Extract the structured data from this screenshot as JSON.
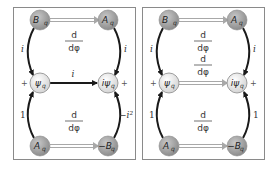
{
  "colors": {
    "frame": "#8a8a8a",
    "dark_node": "#9a9a9a",
    "light_node": "#e6e6e6",
    "arrow_dark": "#1a1a1a",
    "arrow_double": "#a8a8a8"
  },
  "panels": [
    {
      "name": "left",
      "nodes": {
        "top_left": {
          "main": "B",
          "sub": "q"
        },
        "top_right": {
          "main": "A",
          "sub": "q"
        },
        "mid_left": {
          "main": "ψ",
          "sub": "q"
        },
        "mid_right": {
          "main": "iψ",
          "sub": "q"
        },
        "bot_left": {
          "main": "A",
          "sub": "q"
        },
        "bot_right": {
          "main": "−B",
          "sub": "q"
        }
      },
      "edges": {
        "top_deriv_num": "d",
        "top_deriv_den": "dφ",
        "left_top": "i",
        "right_top": "i",
        "middle": "i",
        "bot_deriv_num": "d",
        "bot_deriv_den": "dφ",
        "left_bot": "1",
        "right_bot": "−i²"
      },
      "plus_left": "+",
      "plus_right": "+"
    },
    {
      "name": "right",
      "nodes": {
        "top_left": {
          "main": "B",
          "sub": "q"
        },
        "top_right": {
          "main": "A",
          "sub": "q"
        },
        "mid_left": {
          "main": "ψ",
          "sub": "q"
        },
        "mid_right": {
          "main": "iψ",
          "sub": "q"
        },
        "bot_left": {
          "main": "A",
          "sub": "q"
        },
        "bot_right": {
          "main": "−B",
          "sub": "q"
        }
      },
      "edges": {
        "top_deriv_num": "d",
        "top_deriv_den": "dφ",
        "left_top": "i",
        "right_top": "i",
        "middle_deriv_num": "d",
        "middle_deriv_den": "dφ",
        "bot_deriv_num": "d",
        "bot_deriv_den": "dφ",
        "left_bot": "1",
        "right_bot": "1"
      },
      "plus_left": "+",
      "plus_right": "+"
    }
  ]
}
